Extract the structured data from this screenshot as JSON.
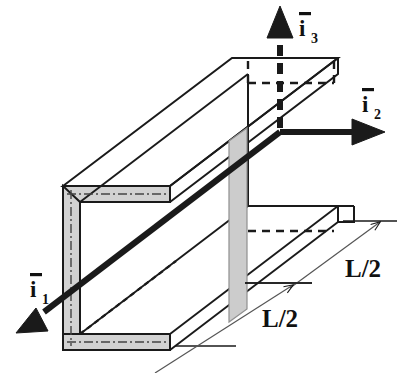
{
  "figure": {
    "kind": "isometric-channel-beam-diagram",
    "background_color": "#ffffff",
    "line_color": "#1a1a1a",
    "shade_color": "#cccccc",
    "shade_color_dark": "#c2c2c2"
  },
  "axes": {
    "vectors": [
      {
        "id": "i1",
        "base": "i",
        "subscript": "1",
        "overbar": true,
        "label_text": "i",
        "direction": "down-left",
        "shaft_style": "solid",
        "shaft_weight": "thick",
        "arrowhead": "solid-triangle"
      },
      {
        "id": "i2",
        "base": "i",
        "subscript": "2",
        "overbar": true,
        "label_text": "i",
        "direction": "right",
        "shaft_style": "solid",
        "shaft_weight": "thick",
        "arrowhead": "solid-triangle"
      },
      {
        "id": "i3",
        "base": "i",
        "subscript": "3",
        "overbar": true,
        "label_text": "i",
        "direction": "up",
        "shaft_style": "dashed",
        "shaft_weight": "thick",
        "arrowhead": "solid-triangle"
      }
    ]
  },
  "dimensions": [
    {
      "id": "dim-upper",
      "label": "L/2",
      "span": "mid-section-to-right-end",
      "arrow_style": "open-thin",
      "ends": "both"
    },
    {
      "id": "dim-lower",
      "label": "L/2",
      "span": "left-end-to-mid-section",
      "arrow_style": "open-thin",
      "ends": "both"
    }
  ],
  "section_plane": {
    "name": "mid-span-cross-section",
    "fill": "#cccccc",
    "shape": "parallelogram"
  }
}
